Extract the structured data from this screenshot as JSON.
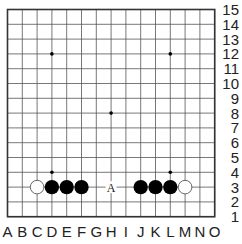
{
  "board": {
    "size": 15,
    "columns": [
      "A",
      "B",
      "C",
      "D",
      "E",
      "F",
      "G",
      "H",
      "I",
      "J",
      "K",
      "L",
      "M",
      "N",
      "O"
    ],
    "rows": [
      "15",
      "14",
      "13",
      "12",
      "11",
      "10",
      "9",
      "8",
      "7",
      "6",
      "5",
      "4",
      "3",
      "2",
      "1"
    ],
    "colors": {
      "background": "#ffffff",
      "line": "#555555",
      "border": "#333333",
      "black_stone": "#000000",
      "white_stone": "#ffffff",
      "white_stone_outline": "#444444",
      "marker": "#222222"
    },
    "star_points": [
      "D12",
      "L12",
      "H8",
      "D4",
      "L4"
    ],
    "stones": [
      {
        "point": "C3",
        "color": "white"
      },
      {
        "point": "D3",
        "color": "black"
      },
      {
        "point": "E3",
        "color": "black"
      },
      {
        "point": "F3",
        "color": "black"
      },
      {
        "point": "J3",
        "color": "black"
      },
      {
        "point": "K3",
        "color": "black"
      },
      {
        "point": "L3",
        "color": "black"
      },
      {
        "point": "M3",
        "color": "white"
      }
    ],
    "markers": [
      {
        "point": "H3",
        "label": "A"
      }
    ]
  }
}
